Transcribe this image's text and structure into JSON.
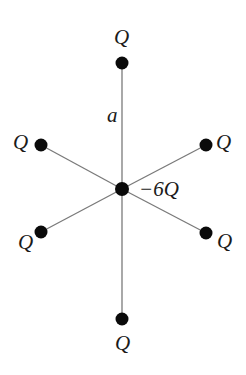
{
  "diagram": {
    "type": "point-charge-configuration",
    "colors": {
      "background": "#ffffff",
      "dot": "#0a0a0a",
      "line": "#7a7a7a",
      "text": "#1a1a1a"
    },
    "center": {
      "label": "−6Q",
      "x": 122,
      "y": 189,
      "label_x": 139,
      "label_y": 196
    },
    "distance_label": {
      "text": "a",
      "x": 107,
      "y": 122
    },
    "charges": [
      {
        "id": "top",
        "label": "Q",
        "x": 122,
        "y": 63,
        "label_x": 114,
        "label_y": 44
      },
      {
        "id": "upper-right",
        "label": "Q",
        "x": 206,
        "y": 145,
        "label_x": 216,
        "label_y": 149
      },
      {
        "id": "lower-right",
        "label": "Q",
        "x": 206,
        "y": 233,
        "label_x": 217,
        "label_y": 248
      },
      {
        "id": "bottom",
        "label": "Q",
        "x": 122,
        "y": 319,
        "label_x": 115,
        "label_y": 350
      },
      {
        "id": "lower-left",
        "label": "Q",
        "x": 41,
        "y": 232,
        "label_x": 18,
        "label_y": 249
      },
      {
        "id": "upper-left",
        "label": "Q",
        "x": 41,
        "y": 145,
        "label_x": 13,
        "label_y": 149
      }
    ],
    "dot_radius": 6.5,
    "center_dot_radius": 7
  }
}
